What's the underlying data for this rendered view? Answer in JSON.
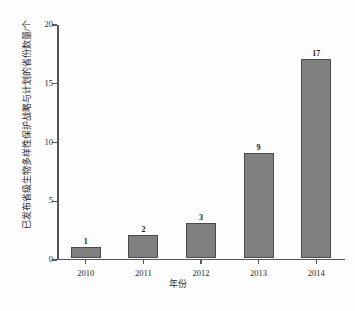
{
  "chart_data": {
    "type": "bar",
    "title": "",
    "categories": [
      "2010",
      "2011",
      "2012",
      "2013",
      "2014"
    ],
    "values": [
      1,
      2,
      3,
      9,
      17
    ],
    "xlabel": "年份",
    "ylabel": "已发布省级生物多样性保护战略与计划的省份数量/个",
    "ylim": [
      0,
      20
    ],
    "yticks": [
      "0",
      "5",
      "10",
      "15",
      "20"
    ],
    "ytick_values": [
      0,
      5,
      10,
      15,
      20
    ],
    "grid": false,
    "legend": null,
    "bar_color": "#808080",
    "bar_edge_color": "#4a4a4a",
    "axis_color": "#555555",
    "background": "#fdfdfd"
  }
}
